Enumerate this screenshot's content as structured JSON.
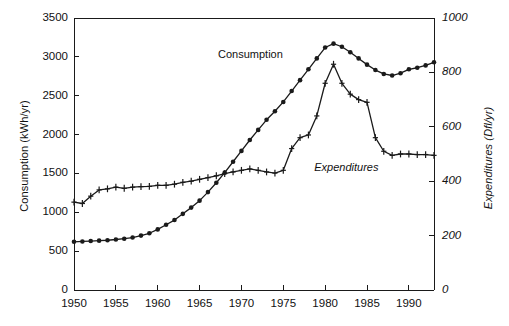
{
  "chart_data": {
    "type": "line",
    "title": "",
    "xlabel": "",
    "ylabel": "Consumption (kWh/yr)",
    "y2label": "Expenditures (Dfl/yr)",
    "xlim": [
      1950,
      1993
    ],
    "ylim": [
      0,
      3500
    ],
    "y2lim": [
      0,
      1000
    ],
    "grid": false,
    "legend_position": "inline-annotations",
    "x_ticks": [
      1950,
      1955,
      1960,
      1965,
      1970,
      1975,
      1980,
      1985,
      1990
    ],
    "x_tick_labels": [
      "1950",
      "1955",
      "1960",
      "1965",
      "1970",
      "1975",
      "1980",
      "1985",
      "1990"
    ],
    "y_ticks": [
      0,
      500,
      1000,
      1500,
      2000,
      2500,
      3000,
      3500
    ],
    "y_tick_labels": [
      "0",
      "500",
      "1000",
      "1500",
      "2000",
      "2500",
      "3000",
      "3500"
    ],
    "y2_ticks": [
      0,
      200,
      400,
      600,
      800,
      1000
    ],
    "y2_tick_labels": [
      "0",
      "200",
      "400",
      "600",
      "800",
      "1000"
    ],
    "annotations": [
      {
        "text": "Consumption",
        "x": 1971.5,
        "y": 3005,
        "style": "normal"
      },
      {
        "text": "Expenditures",
        "x": 1983.0,
        "y": 1560,
        "style": "italic"
      }
    ],
    "series": [
      {
        "name": "Consumption",
        "axis": "left",
        "units": "kWh/yr",
        "marker": "filled-circle",
        "x": [
          1950,
          1951,
          1952,
          1953,
          1954,
          1955,
          1956,
          1957,
          1958,
          1959,
          1960,
          1961,
          1962,
          1963,
          1964,
          1965,
          1966,
          1967,
          1968,
          1969,
          1970,
          1971,
          1972,
          1973,
          1974,
          1975,
          1976,
          1977,
          1978,
          1979,
          1980,
          1981,
          1982,
          1983,
          1984,
          1985,
          1986,
          1987,
          1988,
          1989,
          1990,
          1991,
          1992,
          1993
        ],
        "values": [
          620,
          625,
          630,
          635,
          640,
          650,
          660,
          675,
          700,
          730,
          780,
          840,
          900,
          980,
          1060,
          1150,
          1260,
          1380,
          1510,
          1650,
          1790,
          1930,
          2060,
          2190,
          2300,
          2420,
          2560,
          2700,
          2840,
          2980,
          3120,
          3170,
          3130,
          3060,
          2980,
          2900,
          2830,
          2780,
          2760,
          2790,
          2840,
          2860,
          2890,
          2930
        ]
      },
      {
        "name": "Expenditures",
        "axis": "right",
        "units": "Dfl/yr",
        "marker": "plus",
        "x": [
          1950,
          1951,
          1952,
          1953,
          1954,
          1955,
          1956,
          1957,
          1958,
          1959,
          1960,
          1961,
          1962,
          1963,
          1964,
          1965,
          1966,
          1967,
          1968,
          1969,
          1970,
          1971,
          1972,
          1973,
          1974,
          1975,
          1976,
          1977,
          1978,
          1979,
          1980,
          1981,
          1982,
          1983,
          1984,
          1985,
          1986,
          1987,
          1988,
          1989,
          1990,
          1991,
          1992,
          1993
        ],
        "values": [
          323,
          318,
          345,
          368,
          372,
          378,
          374,
          378,
          380,
          381,
          385,
          385,
          389,
          396,
          400,
          407,
          413,
          420,
          428,
          434,
          440,
          445,
          440,
          434,
          430,
          440,
          520,
          560,
          570,
          640,
          760,
          830,
          760,
          720,
          700,
          690,
          560,
          510,
          495,
          500,
          500,
          498,
          498,
          495
        ]
      }
    ]
  },
  "axes": {
    "left_title": "Consumption (kWh/yr)",
    "right_title": "Expenditures (Dfl/yr)"
  },
  "labels": {
    "consumption": "Consumption",
    "expenditures": "Expenditures"
  }
}
